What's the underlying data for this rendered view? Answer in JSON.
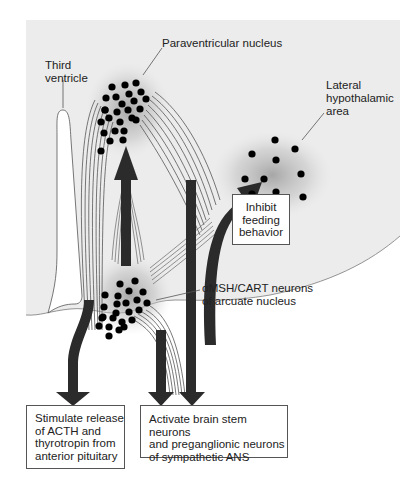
{
  "diagram": {
    "labels": {
      "paraventricular": "Paraventricular nucleus",
      "third_ventricle": [
        "Third",
        "ventricle"
      ],
      "lateral_hypothalamic": [
        "Lateral",
        "hypothalamic",
        "area"
      ],
      "arcuate": [
        "αMSH/CART neurons",
        "of arcuate nucleus"
      ]
    },
    "boxes": {
      "inhibit": [
        "Inhibit",
        "feeding",
        "behavior"
      ],
      "stimulate": [
        "Stimulate release",
        "of ACTH and",
        "thyrotropin from",
        "anterior pituitary"
      ],
      "activate": [
        "Activate brain stem neurons",
        "and preganglionic neurons",
        "of sympathetic ANS"
      ]
    },
    "colors": {
      "background_panel": "#ececec",
      "arrow": "#2b2b2b",
      "dot": "#000000",
      "box_border": "#555555",
      "boundary_line": "#888888"
    },
    "nodes": [
      {
        "id": "paraventricular",
        "dots": 26
      },
      {
        "id": "lateral_hypothalamic",
        "dots": 10
      },
      {
        "id": "arcuate",
        "dots": 24
      }
    ],
    "edges": [
      {
        "from": "arcuate",
        "to": "paraventricular"
      },
      {
        "from": "arcuate",
        "to": "lateral_hypothalamic",
        "effect": "inhibit"
      },
      {
        "from": "paraventricular",
        "to": "stimulate"
      },
      {
        "from": "arcuate",
        "to": "activate"
      },
      {
        "from": "paraventricular",
        "to": "activate"
      }
    ]
  }
}
